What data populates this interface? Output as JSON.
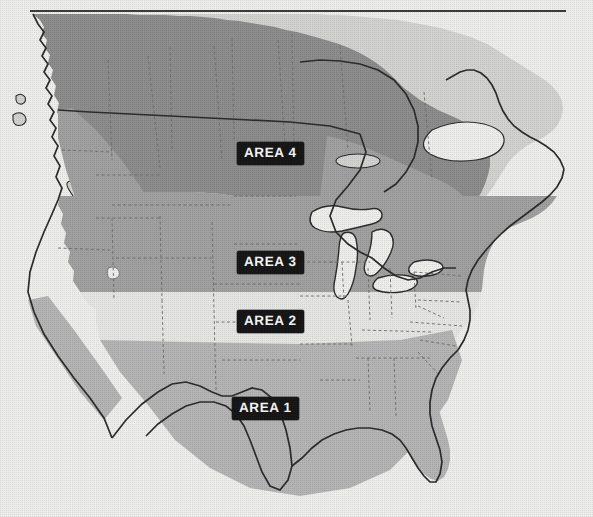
{
  "page": {
    "width": 593,
    "height": 517,
    "background_color": "#eeeeec"
  },
  "header_rule": {
    "name": "top-horizontal-rule",
    "x1": 30,
    "x2": 566,
    "y": 11,
    "color": "#3b3b3b",
    "thickness": 2.2
  },
  "map": {
    "projection_note": "North America, continental United States and southern Canada",
    "outline_color": "#2b2b2b",
    "state_border_color": "#6d6d6d",
    "water_color": "#eeeeec",
    "legend_style": "horizontal banded climate zones, darker = higher area number in north, Area 1 in south",
    "zones": [
      {
        "id": "area1",
        "label": "AREA 1",
        "fill": "#b4b4b4",
        "label_x": 237,
        "label_y": 397,
        "description": "Southern band: Gulf coast, Texas, Deep South, Florida, southern California and southern Arizona"
      },
      {
        "id": "area2",
        "label": "AREA 2",
        "fill": "#e6e6e4",
        "label_x": 237,
        "label_y": 310,
        "description": "Central band: Kansas, Missouri, Kentucky, Virginia, Great Basin, mid-Atlantic"
      },
      {
        "id": "area3",
        "label": "AREA 3",
        "fill": "#a0a0a0",
        "label_x": 237,
        "label_y": 251,
        "description": "Northern band: Nebraska, Iowa, Great Lakes states, New England, Pacific Northwest"
      },
      {
        "id": "area4",
        "label": "AREA 4",
        "fill": "#8c8c8c",
        "label_x": 237,
        "label_y": 142,
        "description": "Far northern band: Dakotas, northern Montana, southern Canadian prairies, Quebec"
      },
      {
        "id": "unshaded",
        "label": "",
        "fill": "#d2d2d0",
        "description": "Canada north of the zone bands and land outside the classified areas"
      }
    ]
  },
  "labels": [
    {
      "id": "area4",
      "text": "AREA 4",
      "x": 237,
      "y": 142
    },
    {
      "id": "area3",
      "text": "AREA 3",
      "x": 237,
      "y": 251
    },
    {
      "id": "area2",
      "text": "AREA 2",
      "x": 237,
      "y": 310
    },
    {
      "id": "area1",
      "text": "AREA 1",
      "x": 232,
      "y": 397
    }
  ]
}
